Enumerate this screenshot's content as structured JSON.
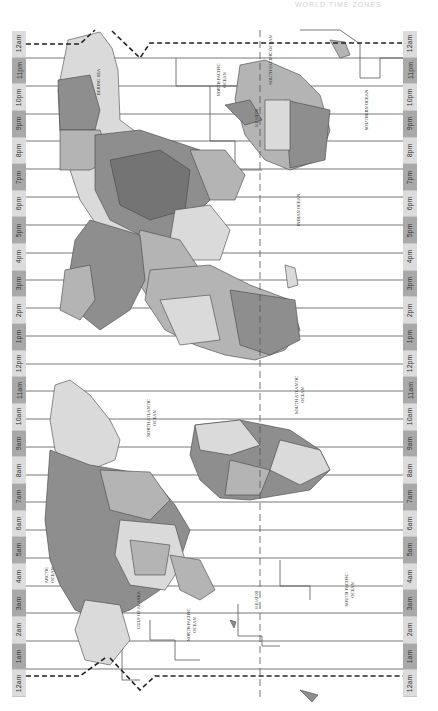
{
  "map": {
    "title_faint": "WORLD TIME ZONES",
    "orientation": "rotated 90° counter-clockwise",
    "colors": {
      "background": "#ffffff",
      "label_light": "#dcdcdc",
      "label_dark": "#a9a9a9",
      "land_light": "#dadada",
      "land_mid": "#b4b4b4",
      "land_dark": "#8e8e8e",
      "land_darker": "#747474",
      "boundary": "#555555"
    },
    "hour_labels": [
      "12am",
      "11pm",
      "10pm",
      "9pm",
      "8pm",
      "7pm",
      "6pm",
      "5pm",
      "4pm",
      "3pm",
      "2pm",
      "1pm",
      "12pm",
      "11am",
      "10am",
      "9am",
      "8am",
      "7am",
      "6am",
      "5am",
      "4am",
      "3am",
      "2am",
      "1am",
      "12am"
    ],
    "oceans": [
      {
        "label": "NORTH PACIFIC OCEAN",
        "x": 220,
        "y": 80
      },
      {
        "label": "SOUTH PACIFIC OCEAN",
        "x": 272,
        "y": 60
      },
      {
        "label": "INDIAN OCEAN",
        "x": 300,
        "y": 210
      },
      {
        "label": "SOUTHERN OCEAN",
        "x": 365,
        "y": 110
      },
      {
        "label": "NORTH ATLANTIC OCEAN",
        "x": 150,
        "y": 418
      },
      {
        "label": "SOUTH ATLANTIC OCEAN",
        "x": 300,
        "y": 395
      },
      {
        "label": "ARCTIC OCEAN",
        "x": 50,
        "y": 575
      },
      {
        "label": "NORTH PACIFIC OCEAN",
        "x": 190,
        "y": 625
      },
      {
        "label": "SOUTH PACIFIC OCEAN",
        "x": 348,
        "y": 585
      },
      {
        "label": "GULF OF ALASKA",
        "x": 138,
        "y": 608
      },
      {
        "label": "BERING SEA",
        "x": 100,
        "y": 80
      }
    ],
    "lines": {
      "equator_label": "EQUATOR",
      "date_line_label": "INTERNATIONAL DATE LINE"
    }
  }
}
